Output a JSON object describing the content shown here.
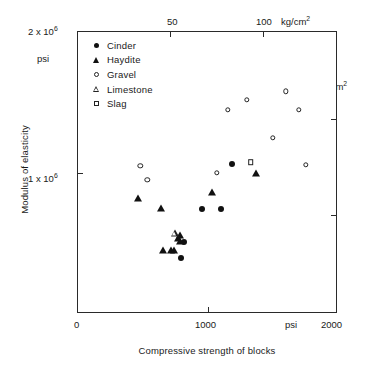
{
  "chart_data": {
    "type": "scatter",
    "title": "",
    "xlabel": "Compressive strength of blocks",
    "ylabel": "Modulus of elasticity",
    "xlim": [
      0,
      2000
    ],
    "ylim": [
      0,
      2000000
    ],
    "grid": false,
    "x_unit_primary": "psi",
    "y_unit_primary": "psi",
    "x_unit_secondary": "kg/cm2",
    "y_unit_secondary": "kg/cm2",
    "x_axis_bottom_ticks": [
      {
        "value": 0,
        "label": "0"
      },
      {
        "value": 1000,
        "label": "1000"
      },
      {
        "value": 2000,
        "label": "2000"
      }
    ],
    "x_axis_bottom_unit_label": "psi",
    "x_axis_top_ticks": [
      {
        "value_kg_cm2": 50,
        "value_psi": 711,
        "label": "50"
      },
      {
        "value_kg_cm2": 100,
        "value_psi": 1422,
        "label": "100"
      }
    ],
    "x_axis_top_unit_label": "kg/cm",
    "x_axis_top_unit_exp": "2",
    "y_axis_left_ticks": [
      {
        "value": 2000000,
        "label": "2 x 10",
        "exp": "6"
      },
      {
        "value": 1000000,
        "label": "1 x 10",
        "exp": "6"
      }
    ],
    "y_axis_left_unit_label": "psi",
    "y_axis_right_ticks": [
      {
        "value_psi": 1422000,
        "label": "1 x 10",
        "exp": "6"
      },
      {
        "value_psi": 711000,
        "label": "0.5 x 10",
        "exp": "6"
      }
    ],
    "y_axis_right_unit_label": "kg/cm",
    "y_axis_right_unit_exp": "2",
    "legend_position": "top-left",
    "series": [
      {
        "name": "Cinder",
        "marker": "filled-circle",
        "color": "#111111",
        "points": [
          {
            "x": 790,
            "y": 400000
          },
          {
            "x": 818,
            "y": 508000
          },
          {
            "x": 950,
            "y": 748000
          },
          {
            "x": 1100,
            "y": 748000
          },
          {
            "x": 1182,
            "y": 1065000
          }
        ]
      },
      {
        "name": "Haydite",
        "marker": "filled-triangle",
        "color": "#111111",
        "points": [
          {
            "x": 655,
            "y": 455000
          },
          {
            "x": 718,
            "y": 455000
          },
          {
            "x": 735,
            "y": 455000
          },
          {
            "x": 770,
            "y": 540000
          },
          {
            "x": 785,
            "y": 520000
          },
          {
            "x": 788,
            "y": 560000
          },
          {
            "x": 460,
            "y": 820000
          },
          {
            "x": 640,
            "y": 750000
          },
          {
            "x": 1030,
            "y": 865000
          },
          {
            "x": 1370,
            "y": 1000000
          }
        ]
      },
      {
        "name": "Gravel",
        "marker": "open-circle",
        "color": "#222222",
        "points": [
          {
            "x": 478,
            "y": 1050000
          },
          {
            "x": 533,
            "y": 950000
          },
          {
            "x": 1070,
            "y": 1000000
          },
          {
            "x": 1152,
            "y": 1450000
          },
          {
            "x": 1298,
            "y": 1520000
          },
          {
            "x": 1500,
            "y": 1250000
          },
          {
            "x": 1598,
            "y": 1580000
          },
          {
            "x": 1700,
            "y": 1450000
          },
          {
            "x": 1752,
            "y": 1060000
          }
        ]
      },
      {
        "name": "Limestone",
        "marker": "open-triangle",
        "color": "#222222",
        "points": [
          {
            "x": 745,
            "y": 578000
          }
        ]
      },
      {
        "name": "Slag",
        "marker": "open-square",
        "color": "#222222",
        "points": [
          {
            "x": 1330,
            "y": 1075000
          }
        ]
      }
    ]
  },
  "legend": {
    "items": [
      {
        "label": "Cinder",
        "marker": "filled-circle"
      },
      {
        "label": "Haydite",
        "marker": "filled-triangle"
      },
      {
        "label": "Gravel",
        "marker": "open-circle"
      },
      {
        "label": "Limestone",
        "marker": "open-triangle"
      },
      {
        "label": "Slag",
        "marker": "open-square"
      }
    ]
  }
}
